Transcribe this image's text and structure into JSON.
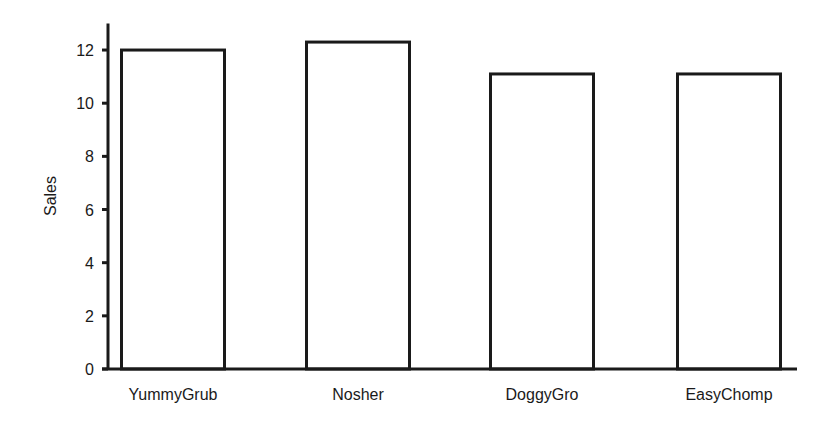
{
  "chart_data": {
    "type": "bar",
    "title": "",
    "xlabel": "",
    "ylabel": "Sales",
    "categories": [
      "YummyGrub",
      "Nosher",
      "DoggyGro",
      "EasyChomp"
    ],
    "values": [
      12.0,
      12.3,
      11.1,
      11.1
    ],
    "ylim": [
      0,
      13
    ],
    "yticks": [
      0,
      2,
      4,
      6,
      8,
      10,
      12
    ],
    "grid": false,
    "legend": null,
    "bar_fill": "#ffffff",
    "bar_stroke": "#1a1a1a",
    "axis_color": "#1a1a1a"
  }
}
